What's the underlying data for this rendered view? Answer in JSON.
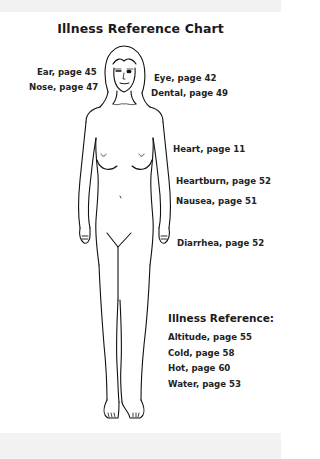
{
  "title": "Illness Reference Chart",
  "labels": {
    "ear": "Ear, page 45",
    "nose": "Nose, page 47",
    "eye": "Eye, page 42",
    "dental": "Dental, page 49",
    "heart": "Heart, page 11",
    "heartburn": "Heartburn, page 52",
    "nausea": "Nausea, page 51",
    "diarrhea": "Diarrhea, page 52"
  },
  "reference": {
    "title": "Illness Reference:",
    "items": [
      "Altitude, page 55",
      "Cold, page 58",
      "Hot, page 60",
      "Water, page 53"
    ]
  },
  "figure": {
    "icon": "human-body-outline-icon"
  }
}
